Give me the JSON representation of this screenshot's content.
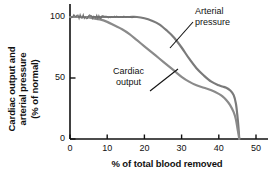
{
  "chart_data": {
    "type": "line",
    "title": "",
    "xlabel": "% of total blood removed",
    "ylabel": "Cardiac output and arterial pressure (% of normal)",
    "ylabel_lines": [
      "Cardiac output and",
      "arterial pressure",
      "(% of normal)"
    ],
    "xlim": [
      0,
      50
    ],
    "ylim": [
      0,
      110
    ],
    "xticks": [
      0,
      10,
      20,
      30,
      40,
      50
    ],
    "xtick_labels": [
      "0",
      "10",
      "20",
      "30",
      "40",
      "50"
    ],
    "yticks": [
      0,
      50,
      100
    ],
    "ytick_labels": [
      "0",
      "50",
      "100"
    ],
    "grid": false,
    "legend": "none",
    "annotations": [
      {
        "text_lines": [
          "Arterial",
          "pressure"
        ],
        "text": "Arterial pressure",
        "points_to_series": "Arterial pressure"
      },
      {
        "text_lines": [
          "Cardiac",
          "output"
        ],
        "text": "Cardiac output",
        "points_to_series": "Cardiac output"
      }
    ],
    "series": [
      {
        "name": "Arterial pressure",
        "color": "#7a7a7a",
        "x": [
          0,
          2,
          4,
          6,
          8,
          10,
          12,
          14,
          16,
          18,
          20,
          22,
          24,
          26,
          28,
          30,
          32,
          34,
          36,
          38,
          40,
          41,
          42,
          43,
          44,
          44.6,
          45,
          45.3,
          45.5
        ],
        "y": [
          100,
          100,
          100,
          100,
          100,
          100,
          100,
          100,
          100,
          100,
          99,
          97,
          94,
          89,
          83,
          75,
          66,
          58,
          52,
          47,
          44,
          43,
          42,
          40,
          36,
          29,
          19,
          9,
          0
        ]
      },
      {
        "name": "Cardiac output",
        "color": "#8a8a8a",
        "x": [
          0,
          2,
          4,
          6,
          8,
          10,
          12,
          14,
          16,
          18,
          20,
          22,
          24,
          26,
          28,
          30,
          32,
          34,
          36,
          38,
          40,
          41,
          42,
          43,
          44,
          44.6,
          45,
          45.3,
          45.5
        ],
        "y": [
          100,
          100,
          100,
          99,
          98,
          96,
          93,
          90,
          86,
          81,
          76,
          71,
          66,
          61,
          56,
          51,
          47,
          44,
          42,
          40,
          37,
          35,
          32,
          28,
          22,
          16,
          9,
          4,
          0
        ]
      }
    ]
  }
}
